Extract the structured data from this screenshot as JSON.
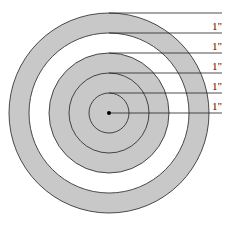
{
  "diagram": {
    "title": "",
    "rings": [
      {
        "index": 1,
        "fill": "#c8c8c8"
      },
      {
        "index": 2,
        "fill": "#ffffff"
      },
      {
        "index": 3,
        "fill": "#c8c8c8"
      },
      {
        "index": 4,
        "fill": "#c8c8c8"
      },
      {
        "index": 5,
        "fill": "#c8c8c8"
      }
    ],
    "labels": [
      "1\"",
      "1\"",
      "1\"",
      "1\"",
      "1\""
    ],
    "stroke_color": "#222222",
    "center_dot_color": "#000000"
  }
}
